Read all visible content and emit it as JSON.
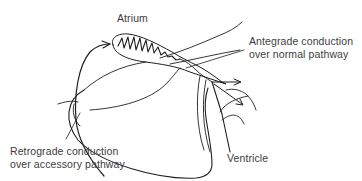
{
  "diagram": {
    "type": "anatomical schematic",
    "labels": {
      "atrium": "Atrium",
      "antegrade_line1": "Antegrade conduction",
      "antegrade_line2": "over normal pathway",
      "retrograde_line1": "Retrograde conduction",
      "retrograde_line2": "over accessory pathway",
      "ventricle": "Ventricle"
    },
    "colors": {
      "stroke": "#1e1e1e",
      "text": "#3c3c3c",
      "background": "#ffffff"
    }
  }
}
